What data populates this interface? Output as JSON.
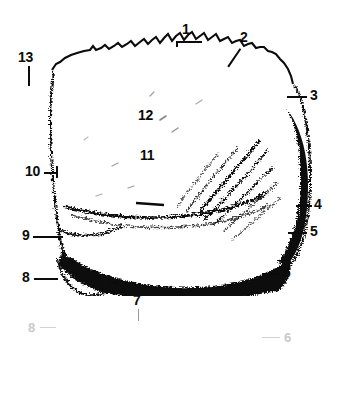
{
  "figure": {
    "background_color": "#ffffff",
    "ink_color": "#0b0b0b",
    "reflection_color": "#9a9a9a",
    "canvas": {
      "width": 340,
      "height": 403
    }
  },
  "labels": [
    {
      "id": "1",
      "text": "1",
      "x": 182,
      "y": 22,
      "leader": "horizontal-below"
    },
    {
      "id": "2",
      "text": "2",
      "x": 240,
      "y": 36,
      "leader": "diagonal-down-left"
    },
    {
      "id": "3",
      "text": "3",
      "x": 310,
      "y": 90,
      "leader": "horizontal-left"
    },
    {
      "id": "4",
      "text": "4",
      "x": 314,
      "y": 199,
      "leader": "horizontal-left"
    },
    {
      "id": "5",
      "text": "5",
      "x": 310,
      "y": 226,
      "leader": "horizontal-left"
    },
    {
      "id": "6",
      "text": "6",
      "x": 283,
      "y": 267,
      "leader": "horizontal-left"
    },
    {
      "id": "7",
      "text": "7",
      "x": 133,
      "y": 295,
      "leader": "vertical-up-thin"
    },
    {
      "id": "8",
      "text": "8",
      "x": 22,
      "y": 272,
      "leader": "horizontal-right"
    },
    {
      "id": "9",
      "text": "9",
      "x": 22,
      "y": 230,
      "leader": "horizontal-right"
    },
    {
      "id": "10",
      "text": "10",
      "x": 25,
      "y": 166,
      "leader": "horizontal-right"
    },
    {
      "id": "11",
      "text": "11",
      "x": 140,
      "y": 150,
      "leader": "none"
    },
    {
      "id": "12",
      "text": "12",
      "x": 138,
      "y": 110,
      "leader": "none"
    },
    {
      "id": "13",
      "text": "13",
      "x": 18,
      "y": 52,
      "leader": "vertical-down"
    }
  ],
  "ghost_labels": [
    {
      "id": "ghost-8",
      "text": "8",
      "x": 28,
      "y": 327
    },
    {
      "id": "ghost-6",
      "text": "6",
      "x": 284,
      "y": 337
    }
  ]
}
